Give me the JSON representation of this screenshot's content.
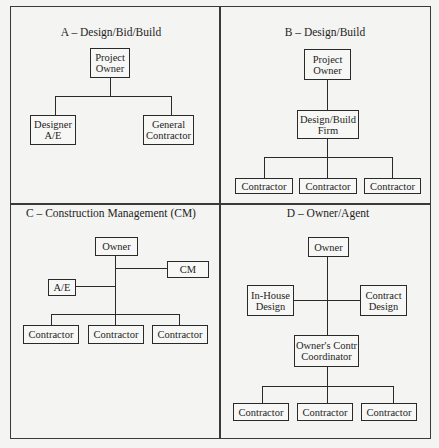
{
  "panels": {
    "a": {
      "title": "A – Design/Bid/Build",
      "owner": [
        "Project",
        "Owner"
      ],
      "designer": [
        "Designer",
        "A/E"
      ],
      "contractor": [
        "General",
        "Contractor"
      ]
    },
    "b": {
      "title": "B – Design/Build",
      "owner": [
        "Project",
        "Owner"
      ],
      "firm": [
        "Design/Build",
        "Firm"
      ],
      "contractors": [
        "Contractor",
        "Contractor",
        "Contractor"
      ]
    },
    "c": {
      "title": "C – Construction Management (CM)",
      "owner": "Owner",
      "cm": "CM",
      "ae": "A/E",
      "contractors": [
        "Contractor",
        "Contractor",
        "Contractor"
      ]
    },
    "d": {
      "title": "D – Owner/Agent",
      "owner": "Owner",
      "inhouse": [
        "In-House",
        "Design"
      ],
      "contract": [
        "Contract",
        "Design"
      ],
      "coordinator": [
        "Owner's Contr",
        "Coordinator"
      ],
      "contractors": [
        "Contractor",
        "Contractor",
        "Contractor"
      ]
    }
  }
}
